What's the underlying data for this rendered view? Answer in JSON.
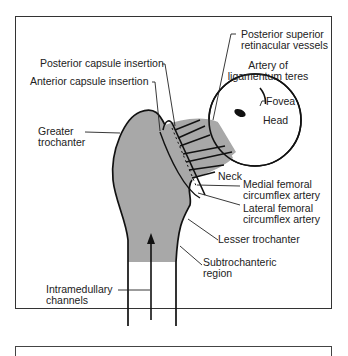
{
  "diagram": {
    "colors": {
      "bone_fill": "#a8a8a8",
      "line": "#111111",
      "frame": "#333333",
      "background": "#ffffff"
    },
    "labels": {
      "posterior_superior_retinacular": [
        "Posterior superior",
        "retinacular vessels"
      ],
      "posterior_capsule": "Posterior capsule insertion",
      "anterior_capsule": "Anterior capsule insertion",
      "artery_lig_teres": [
        "Artery of",
        "ligamentum teres"
      ],
      "fovea": "Fovea",
      "head": "Head",
      "greater_trochanter": [
        "Greater",
        "trochanter"
      ],
      "neck": "Neck",
      "medial_femoral": [
        "Medial femoral",
        "circumflex artery"
      ],
      "lateral_femoral": [
        "Lateral femoral",
        "circumflex artery"
      ],
      "lesser_trochanter": "Lesser trochanter",
      "subtrochanteric": [
        "Subtrochanteric",
        "region"
      ],
      "intramedullary": [
        "Intramedullary",
        "channels"
      ]
    }
  }
}
